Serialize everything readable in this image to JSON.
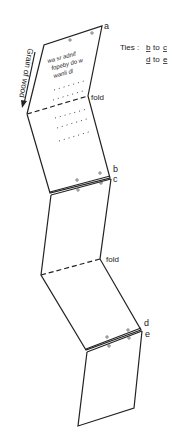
{
  "labels": {
    "a": "a",
    "b": "b",
    "c": "c",
    "d": "d",
    "e": "e",
    "fold1": "fold",
    "fold2": "fold",
    "grain": "Grain of wood"
  },
  "legend": {
    "prefix": "Ties :",
    "tie1_from": "b",
    "tie1_word": "to",
    "tie1_to": "c",
    "tie2_from": "d",
    "tie2_word": "to",
    "tie2_to": "e"
  },
  "inscription": {
    "line1": "wa sr adnif",
    "line2": "fopeby do w",
    "line3": "wanli dl"
  },
  "colors": {
    "line": "#222222",
    "background": "#ffffff"
  }
}
